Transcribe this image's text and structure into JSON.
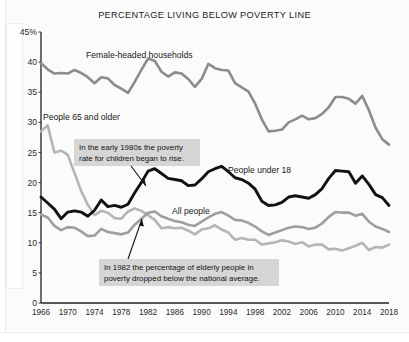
{
  "figure": {
    "title": "PERCENTAGE LIVING BELOW POVERTY LINE",
    "background_color": "#fbfbfb"
  },
  "axes": {
    "y_ticks": [
      "0",
      "5",
      "10",
      "15",
      "20",
      "25",
      "30",
      "35",
      "40",
      "45%"
    ],
    "x_ticks": [
      "1966",
      "1970",
      "1974",
      "1978",
      "1982",
      "1986",
      "1990",
      "1994",
      "1998",
      "2002",
      "2006",
      "2010",
      "2014",
      "2018"
    ]
  },
  "series_labels": {
    "female_headed": "Female-headed households",
    "people_65": "People 65 and older",
    "people_under_18": "People under 18",
    "all_people": "All people"
  },
  "callouts": [
    {
      "id": "callout-children",
      "line1": "In the early 1980s the poverty",
      "line2": "rate for children began to rise."
    },
    {
      "id": "callout-elderly",
      "line1": "In 1982 the percentage of elderly people in",
      "line2": "poverty dropped below the national average."
    }
  ],
  "chart_data": {
    "type": "line",
    "title": "PERCENTAGE LIVING BELOW POVERTY LINE",
    "xlabel": "",
    "ylabel": "",
    "xlim": [
      1966,
      2018
    ],
    "ylim": [
      0,
      45
    ],
    "grid": false,
    "legend_position": "inline-labels",
    "x": [
      1966,
      1967,
      1968,
      1969,
      1970,
      1971,
      1972,
      1973,
      1974,
      1975,
      1976,
      1977,
      1978,
      1979,
      1980,
      1981,
      1982,
      1983,
      1984,
      1985,
      1986,
      1987,
      1988,
      1989,
      1990,
      1991,
      1992,
      1993,
      1994,
      1995,
      1996,
      1997,
      1998,
      1999,
      2000,
      2001,
      2002,
      2003,
      2004,
      2005,
      2006,
      2007,
      2008,
      2009,
      2010,
      2011,
      2012,
      2013,
      2014,
      2015,
      2016,
      2017,
      2018
    ],
    "series": [
      {
        "name": "Female-headed households",
        "color": "#8c8c8c",
        "values": [
          39.8,
          38.8,
          38.1,
          38.2,
          38.1,
          38.7,
          38.2,
          37.5,
          36.5,
          37.5,
          37.3,
          36.2,
          35.6,
          34.9,
          36.7,
          38.7,
          40.6,
          40.2,
          38.4,
          37.6,
          38.3,
          38.1,
          37.2,
          35.9,
          37.2,
          39.7,
          39.0,
          38.7,
          38.6,
          36.5,
          35.8,
          35.1,
          33.1,
          30.5,
          28.5,
          28.6,
          28.8,
          30.0,
          30.5,
          31.1,
          30.5,
          30.7,
          31.4,
          32.5,
          34.2,
          34.2,
          33.9,
          33.1,
          34.4,
          32.0,
          29.1,
          27.2,
          26.3
        ]
      },
      {
        "name": "People 65 and older",
        "color": "#b5b5b5",
        "values": [
          28.5,
          29.5,
          25.0,
          25.3,
          24.6,
          21.6,
          18.6,
          16.3,
          14.6,
          15.3,
          15.0,
          14.1,
          14.0,
          15.2,
          15.7,
          15.3,
          14.6,
          13.8,
          12.4,
          12.6,
          12.4,
          12.5,
          12.0,
          11.4,
          12.2,
          12.4,
          12.9,
          12.2,
          11.7,
          10.5,
          10.8,
          10.5,
          10.5,
          9.7,
          9.9,
          10.1,
          10.4,
          10.2,
          9.8,
          10.1,
          9.4,
          9.7,
          9.7,
          8.9,
          9.0,
          8.7,
          9.1,
          9.5,
          10.0,
          8.8,
          9.3,
          9.2,
          9.7
        ]
      },
      {
        "name": "People under 18",
        "color": "#111111",
        "values": [
          17.6,
          16.6,
          15.6,
          14.0,
          15.1,
          15.3,
          15.1,
          14.4,
          15.4,
          17.1,
          16.0,
          16.2,
          15.9,
          16.4,
          18.3,
          20.0,
          21.9,
          22.3,
          21.5,
          20.7,
          20.5,
          20.3,
          19.5,
          19.6,
          20.6,
          21.8,
          22.3,
          22.7,
          21.8,
          20.8,
          20.5,
          19.9,
          18.9,
          16.9,
          16.2,
          16.3,
          16.7,
          17.6,
          17.8,
          17.6,
          17.4,
          18.0,
          19.0,
          20.7,
          22.0,
          21.9,
          21.8,
          19.9,
          21.1,
          19.7,
          18.0,
          17.5,
          16.2
        ]
      },
      {
        "name": "All people",
        "color": "#9e9e9e",
        "values": [
          14.7,
          14.2,
          12.8,
          12.1,
          12.6,
          12.5,
          11.9,
          11.1,
          11.2,
          12.3,
          11.8,
          11.6,
          11.4,
          11.7,
          13.0,
          14.0,
          15.0,
          15.2,
          14.4,
          14.0,
          13.6,
          13.4,
          13.0,
          12.8,
          13.5,
          14.2,
          14.8,
          15.1,
          14.5,
          13.8,
          13.7,
          13.3,
          12.7,
          11.9,
          11.3,
          11.7,
          12.1,
          12.5,
          12.7,
          12.6,
          12.3,
          12.5,
          13.2,
          14.3,
          15.1,
          15.0,
          15.0,
          14.5,
          14.8,
          13.5,
          12.7,
          12.3,
          11.8
        ]
      }
    ]
  }
}
